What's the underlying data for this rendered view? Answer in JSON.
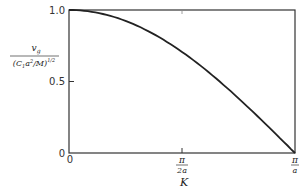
{
  "chart_data": {
    "type": "line",
    "title": "",
    "xlabel": "K",
    "ylabel": "v_g / (C_1 a^2 / M)^{1/2}",
    "ylabel_parts": {
      "numerator": "v",
      "numerator_sub": "g",
      "denominator": "(C",
      "denominator_sub": "1",
      "denominator_rest": "a",
      "denominator_sup": "2",
      "denominator_end": "/M)",
      "denominator_exp": "1/2"
    },
    "x_ticks": [
      {
        "label_num": "0",
        "label_den": "",
        "value": 0
      },
      {
        "label_num": "π",
        "label_den": "2a",
        "value": 0.5
      },
      {
        "label_num": "π",
        "label_den": "a",
        "value": 1.0
      }
    ],
    "y_ticks": [
      {
        "label": "0",
        "value": 0
      },
      {
        "label": "0.5",
        "value": 0.5
      },
      {
        "label": "1.0",
        "value": 1.0
      }
    ],
    "xlim": [
      0,
      1
    ],
    "ylim": [
      0,
      1
    ],
    "x_units": "π/a",
    "grid": false,
    "legend": null,
    "series": [
      {
        "name": "group velocity",
        "x": [
          0,
          0.1,
          0.2,
          0.3,
          0.4,
          0.5,
          0.6,
          0.7,
          0.8,
          0.9,
          1.0
        ],
        "values": [
          1.0,
          0.988,
          0.951,
          0.891,
          0.809,
          0.707,
          0.588,
          0.454,
          0.309,
          0.156,
          0.0
        ]
      }
    ]
  }
}
